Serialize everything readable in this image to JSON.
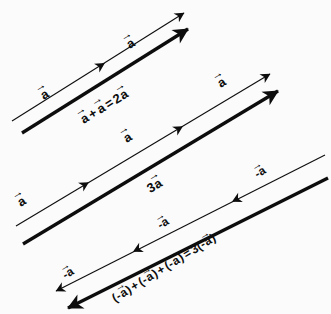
{
  "figure": {
    "background_color": "#fbfbfb",
    "ink_color": "#0d0d0d",
    "width": 331,
    "height": 314
  },
  "diagram_data": {
    "type": "vector-diagram",
    "angle_degrees": -31.5,
    "groups": [
      {
        "name": "two-a",
        "component_vector_label": "a",
        "component_count": 2,
        "component_direction": "up-right",
        "resultant_label": "a + a = 2a",
        "resultant_weight": "thick"
      },
      {
        "name": "three-a",
        "component_vector_label": "a",
        "component_count": 3,
        "component_direction": "up-right",
        "resultant_label": "3a",
        "resultant_weight": "thick"
      },
      {
        "name": "three-negative-a",
        "component_vector_label": "-a",
        "component_count": 3,
        "component_direction": "down-left",
        "resultant_label": "(-a) + (-a) + (-a) = 3(-a)",
        "resultant_weight": "thick"
      }
    ]
  },
  "labels": {
    "g1_component_1": "a",
    "g1_component_2": "a",
    "g1_resultant_a1": "a",
    "g1_resultant_plus": "+",
    "g1_resultant_a2": "a",
    "g1_resultant_equals": "=",
    "g1_resultant_coef": "2",
    "g1_resultant_a3": "a",
    "g2_component_1": "a",
    "g2_component_2": "a",
    "g2_resultant_coef": "3",
    "g2_resultant_a": "a",
    "g3_component_1": "-a",
    "g3_component_2": "-a",
    "g3_component_3": "-a",
    "g3_open1": "(-",
    "g3_a1": "a",
    "g3_close1": ")",
    "g3_plus1": "+",
    "g3_open2": "(-",
    "g3_a2": "a",
    "g3_close2": ")",
    "g3_plus2": "+",
    "g3_open3": "(-",
    "g3_a3": "a",
    "g3_close3": ")",
    "g3_equals": "=",
    "g3_coef": "3",
    "g3_open4": "(-",
    "g3_a4": "a",
    "g3_close4": ")",
    "arrow_glyph": "→"
  }
}
